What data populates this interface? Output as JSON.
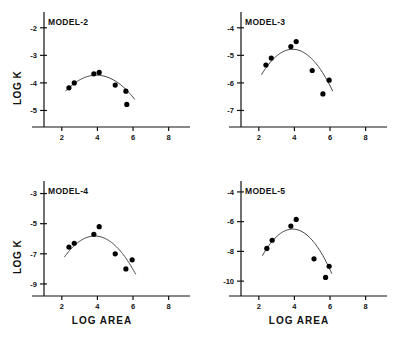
{
  "figure": {
    "panel_count": 4,
    "axis_color": "#111111",
    "point_color": "#000000",
    "curve_color": "#444444"
  },
  "labels": {
    "ylabel": "LOG K",
    "xlabel": "LOG AREA"
  },
  "chart_data": [
    {
      "type": "scatter",
      "title": "MODEL-2",
      "xlabel": "LOG AREA",
      "ylabel": "LOG K",
      "xlim": [
        1.0,
        9.2
      ],
      "ylim": [
        -5.6,
        -1.5
      ],
      "xticks": [
        2,
        4,
        6,
        8
      ],
      "yticks": [
        -2,
        -3,
        -4,
        -5
      ],
      "grid": false,
      "legend": "none",
      "x": [
        2.4,
        2.7,
        3.8,
        4.1,
        5.0,
        5.6,
        5.65
      ],
      "y": [
        -4.18,
        -4.0,
        -3.67,
        -3.62,
        -4.08,
        -4.3,
        -4.78
      ],
      "fit_curve": {
        "kind": "quadratic",
        "vertex_x": 3.95,
        "vertex_y": -3.72,
        "a": -0.19,
        "x_start": 2.2,
        "x_end": 6.1
      }
    },
    {
      "type": "scatter",
      "title": "MODEL-3",
      "xlabel": "LOG AREA",
      "ylabel": "LOG K",
      "xlim": [
        1.0,
        9.2
      ],
      "ylim": [
        -7.6,
        -3.5
      ],
      "xticks": [
        2,
        4,
        6,
        8
      ],
      "yticks": [
        -4,
        -5,
        -6,
        -7
      ],
      "grid": false,
      "legend": "none",
      "x": [
        2.4,
        2.7,
        3.8,
        4.1,
        5.0,
        5.6,
        5.95
      ],
      "y": [
        -5.35,
        -5.1,
        -4.68,
        -4.5,
        -5.55,
        -6.4,
        -5.9
      ],
      "fit_curve": {
        "kind": "quadratic",
        "vertex_x": 3.9,
        "vertex_y": -4.78,
        "a": -0.3,
        "x_start": 2.15,
        "x_end": 6.15
      }
    },
    {
      "type": "scatter",
      "title": "MODEL-4",
      "xlabel": "LOG AREA",
      "ylabel": "LOG K",
      "xlim": [
        1.0,
        9.2
      ],
      "ylim": [
        -9.8,
        -2.3
      ],
      "xticks": [
        2,
        4,
        6,
        8
      ],
      "yticks": [
        -3,
        -5,
        -7,
        -9
      ],
      "grid": false,
      "legend": "none",
      "x": [
        2.4,
        2.7,
        3.8,
        4.1,
        5.0,
        5.6,
        5.95
      ],
      "y": [
        -6.55,
        -6.3,
        -5.7,
        -5.2,
        -7.0,
        -8.0,
        -7.4
      ],
      "fit_curve": {
        "kind": "quadratic",
        "vertex_x": 3.85,
        "vertex_y": -5.82,
        "a": -0.48,
        "x_start": 2.15,
        "x_end": 6.15
      }
    },
    {
      "type": "scatter",
      "title": "MODEL-5",
      "xlabel": "LOG AREA",
      "ylabel": "LOG K",
      "xlim": [
        1.0,
        9.2
      ],
      "ylim": [
        -11.0,
        -3.4
      ],
      "xticks": [
        2,
        4,
        6,
        8
      ],
      "yticks": [
        -4,
        -6,
        -8,
        -10
      ],
      "grid": false,
      "legend": "none",
      "x": [
        2.45,
        2.75,
        3.8,
        4.1,
        5.1,
        5.75,
        5.95
      ],
      "y": [
        -7.8,
        -7.25,
        -6.3,
        -5.85,
        -8.5,
        -9.75,
        -9.0
      ],
      "fit_curve": {
        "kind": "quadratic",
        "vertex_x": 3.9,
        "vertex_y": -6.5,
        "a": -0.62,
        "x_start": 2.2,
        "x_end": 6.1
      }
    }
  ]
}
